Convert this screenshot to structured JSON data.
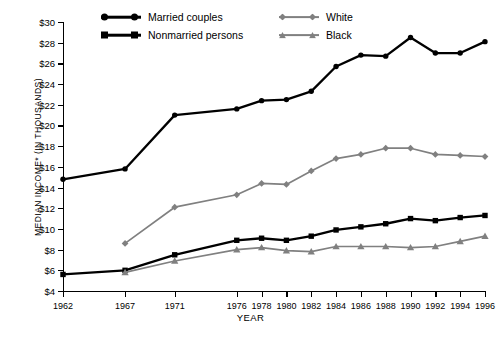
{
  "chart_data": {
    "type": "line",
    "title": "",
    "xlabel": "YEAR",
    "ylabel": "MEDIAN INCOME* (IN THOUSANDS)",
    "x": [
      1962,
      1967,
      1971,
      1976,
      1978,
      1980,
      1982,
      1984,
      1986,
      1988,
      1990,
      1992,
      1994,
      1996
    ],
    "xtick_labels": [
      "1962",
      "1967",
      "1971",
      "1976",
      "1978",
      "1980",
      "1982",
      "1984",
      "1986",
      "1988",
      "1990",
      "1992",
      "1994",
      "1996"
    ],
    "ytick_labels": [
      "$4",
      "$6",
      "$8",
      "$10",
      "$12",
      "$14",
      "$16",
      "$18",
      "$20",
      "$22",
      "$24",
      "$26",
      "$28",
      "$30"
    ],
    "ytick_values": [
      4,
      6,
      8,
      10,
      12,
      14,
      16,
      18,
      20,
      22,
      24,
      26,
      28,
      30
    ],
    "ylim": [
      4,
      30
    ],
    "xlim": [
      1962,
      1996
    ],
    "grid": false,
    "legend_position": "top-center",
    "series": [
      {
        "name": "Married couples",
        "color": "#000000",
        "marker": "circle",
        "x": [
          1962,
          1967,
          1971,
          1976,
          1978,
          1980,
          1982,
          1984,
          1986,
          1988,
          1990,
          1992,
          1994,
          1996
        ],
        "values": [
          14.8,
          15.8,
          21.0,
          21.6,
          22.4,
          22.5,
          23.3,
          25.7,
          26.8,
          26.7,
          28.5,
          27.0,
          27.0,
          28.1
        ]
      },
      {
        "name": "Nonmarried persons",
        "color": "#000000",
        "marker": "square",
        "x": [
          1962,
          1967,
          1971,
          1976,
          1978,
          1980,
          1982,
          1984,
          1986,
          1988,
          1990,
          1992,
          1994,
          1996
        ],
        "values": [
          5.6,
          6.0,
          7.5,
          8.9,
          9.1,
          8.9,
          9.3,
          9.9,
          10.2,
          10.5,
          11.0,
          10.8,
          11.1,
          11.3
        ]
      },
      {
        "name": "White",
        "color": "#808080",
        "marker": "diamond",
        "x": [
          1967,
          1971,
          1976,
          1978,
          1980,
          1982,
          1984,
          1986,
          1988,
          1990,
          1992,
          1994,
          1996
        ],
        "values": [
          8.6,
          12.1,
          13.3,
          14.4,
          14.3,
          15.6,
          16.8,
          17.2,
          17.8,
          17.8,
          17.2,
          17.1,
          17.0
        ]
      },
      {
        "name": "Black",
        "color": "#808080",
        "marker": "triangle",
        "x": [
          1967,
          1971,
          1976,
          1978,
          1980,
          1982,
          1984,
          1986,
          1988,
          1990,
          1992,
          1994,
          1996
        ],
        "values": [
          5.8,
          6.9,
          8.0,
          8.2,
          7.9,
          7.8,
          8.3,
          8.3,
          8.3,
          8.2,
          8.3,
          8.8,
          9.3
        ]
      }
    ]
  },
  "legend": {
    "items": [
      {
        "label": "Married couples",
        "marker": "circle",
        "color": "#000000"
      },
      {
        "label": "Nonmarried persons",
        "marker": "square",
        "color": "#000000"
      },
      {
        "label": "White",
        "marker": "diamond",
        "color": "#808080"
      },
      {
        "label": "Black",
        "marker": "triangle",
        "color": "#808080"
      }
    ]
  }
}
